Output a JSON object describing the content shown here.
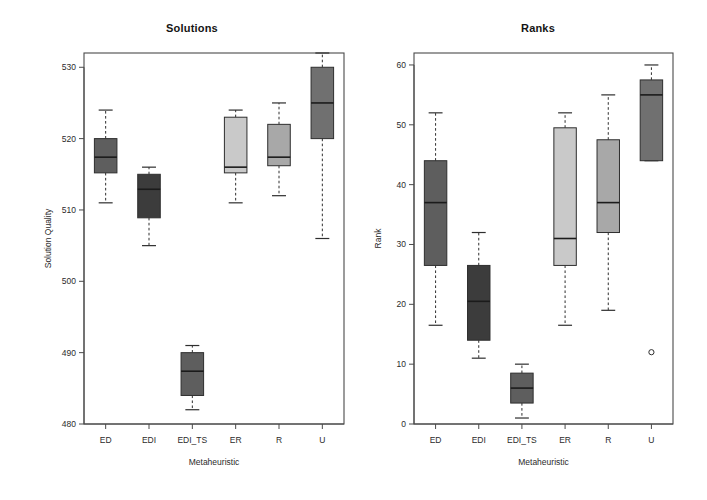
{
  "figure": {
    "background_color": "#ffffff",
    "width": 707,
    "height": 500
  },
  "panels": [
    {
      "key": "solutions",
      "title": "Solutions",
      "xlabel": "Metaheuristic",
      "ylabel": "Solution Quality"
    },
    {
      "key": "ranks",
      "title": "Ranks",
      "xlabel": "Metaheuristic",
      "ylabel": "Rank"
    }
  ],
  "chart_data": [
    {
      "type": "box",
      "title": "Solutions",
      "xlabel": "Metaheuristic",
      "ylabel": "Solution Quality",
      "categories": [
        "ED",
        "EDI",
        "EDI_TS",
        "ER",
        "R",
        "U"
      ],
      "ylim": [
        480,
        532
      ],
      "yticks": [
        480,
        490,
        500,
        510,
        520,
        530
      ],
      "ytick_labels": [
        "480",
        "490",
        "500",
        "510",
        "520",
        "530"
      ],
      "grid": false,
      "legend": "none",
      "boxes": [
        {
          "category": "ED",
          "whisker_low": 511,
          "q1": 515.2,
          "median": 517.4,
          "q3": 520,
          "whisker_high": 524,
          "outliers": [],
          "fill": "#5e5e5e"
        },
        {
          "category": "EDI",
          "whisker_low": 505,
          "q1": 508.9,
          "median": 512.9,
          "q3": 515,
          "whisker_high": 516,
          "outliers": [],
          "fill": "#3c3c3c"
        },
        {
          "category": "EDI_TS",
          "whisker_low": 482,
          "q1": 484,
          "median": 487.4,
          "q3": 490,
          "whisker_high": 491,
          "outliers": [],
          "fill": "#5e5e5e"
        },
        {
          "category": "ER",
          "whisker_low": 511,
          "q1": 515.2,
          "median": 516,
          "q3": 523,
          "whisker_high": 524,
          "outliers": [],
          "fill": "#c9c9c9"
        },
        {
          "category": "R",
          "whisker_low": 512,
          "q1": 516.2,
          "median": 517.4,
          "q3": 522,
          "whisker_high": 525,
          "outliers": [],
          "fill": "#a8a8a8"
        },
        {
          "category": "U",
          "whisker_low": 506,
          "q1": 520,
          "median": 525,
          "q3": 530,
          "whisker_high": 532,
          "outliers": [],
          "fill": "#707070"
        }
      ]
    },
    {
      "type": "box",
      "title": "Ranks",
      "xlabel": "Metaheuristic",
      "ylabel": "Rank",
      "categories": [
        "ED",
        "EDI",
        "EDI_TS",
        "ER",
        "R",
        "U"
      ],
      "ylim": [
        0,
        62
      ],
      "yticks": [
        0,
        10,
        20,
        30,
        40,
        50,
        60
      ],
      "ytick_labels": [
        "0",
        "10",
        "20",
        "30",
        "40",
        "50",
        "60"
      ],
      "grid": false,
      "legend": "none",
      "boxes": [
        {
          "category": "ED",
          "whisker_low": 16.5,
          "q1": 26.5,
          "median": 37,
          "q3": 44,
          "whisker_high": 52,
          "outliers": [],
          "fill": "#5e5e5e"
        },
        {
          "category": "EDI",
          "whisker_low": 11,
          "q1": 14,
          "median": 20.5,
          "q3": 26.5,
          "whisker_high": 32,
          "outliers": [],
          "fill": "#3c3c3c"
        },
        {
          "category": "EDI_TS",
          "whisker_low": 1,
          "q1": 3.5,
          "median": 6,
          "q3": 8.5,
          "whisker_high": 10,
          "outliers": [],
          "fill": "#5e5e5e"
        },
        {
          "category": "ER",
          "whisker_low": 16.5,
          "q1": 26.5,
          "median": 31,
          "q3": 49.5,
          "whisker_high": 52,
          "outliers": [],
          "fill": "#c9c9c9"
        },
        {
          "category": "R",
          "whisker_low": 19,
          "q1": 32,
          "median": 37,
          "q3": 47.5,
          "whisker_high": 55,
          "outliers": [],
          "fill": "#a8a8a8"
        },
        {
          "category": "U",
          "whisker_low": 44,
          "q1": 44,
          "median": 55,
          "q3": 57.5,
          "whisker_high": 60,
          "outliers": [
            12
          ],
          "fill": "#707070"
        }
      ]
    }
  ]
}
